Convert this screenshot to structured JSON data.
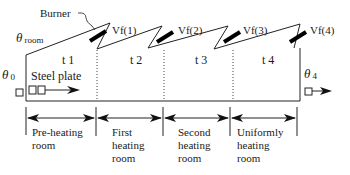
{
  "labels": {
    "burner": "Burner",
    "theta_room_symbol": "θ",
    "theta_room_sub": "room",
    "theta0_symbol": "θ",
    "theta0_sub": "0",
    "theta4_symbol": "θ",
    "theta4_sub": "4",
    "steel_plate": "Steel plate"
  },
  "burners": [
    {
      "label": "Vf(1)"
    },
    {
      "label": "Vf(2)"
    },
    {
      "label": "Vf(3)"
    },
    {
      "label": "Vf(4)"
    }
  ],
  "zones": [
    {
      "temp_label": "t 1",
      "room_name": "Pre-heating room",
      "lines": [
        "Pre-heating",
        "room"
      ]
    },
    {
      "temp_label": "t 2",
      "room_name": "First heating room",
      "lines": [
        "First",
        "heating",
        "room"
      ]
    },
    {
      "temp_label": "t 3",
      "room_name": "Second heating room",
      "lines": [
        "Second",
        "heating",
        "room"
      ]
    },
    {
      "temp_label": "t 4",
      "room_name": "Uniformly heating room",
      "lines": [
        "Uniformly",
        "heating",
        "room"
      ]
    }
  ],
  "caption": "Figure: Schematic of reheating furnace zones"
}
